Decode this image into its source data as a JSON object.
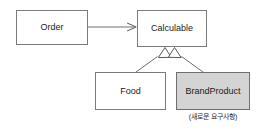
{
  "diagram": {
    "type": "uml-class-diagram",
    "background_color": "#ffffff",
    "nodes": [
      {
        "id": "order",
        "label": "Order",
        "fill": "#ffffff",
        "stroke": "#7b7b7b"
      },
      {
        "id": "calculable",
        "label": "Calculable",
        "fill": "#ffffff",
        "stroke": "#7b7b7b"
      },
      {
        "id": "food",
        "label": "Food",
        "fill": "#ffffff",
        "stroke": "#7b7b7b"
      },
      {
        "id": "brandproduct",
        "label": "BrandProduct",
        "fill": "#d4d4d4",
        "stroke": "#6f6f6f",
        "caption": "(새로운 요구사항)"
      }
    ],
    "edges": [
      {
        "id": "order-to-calculable",
        "from": "order",
        "to": "calculable",
        "arrow": "open-arrow",
        "style": "solid"
      },
      {
        "id": "food-to-calculable",
        "from": "food",
        "to": "calculable",
        "arrow": "hollow-triangle",
        "style": "solid"
      },
      {
        "id": "brandproduct-to-calculable",
        "from": "brandproduct",
        "to": "calculable",
        "arrow": "hollow-triangle",
        "style": "solid"
      }
    ]
  }
}
